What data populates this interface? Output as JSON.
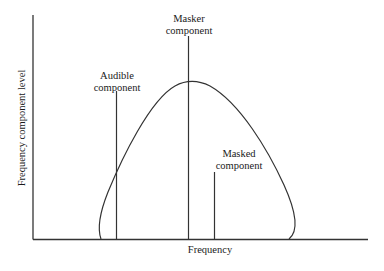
{
  "diagram": {
    "type": "frequency-masking-illustration",
    "x_axis_label": "Frequency",
    "y_axis_label": "Frequency component level",
    "components": [
      {
        "id": "audible",
        "label_line1": "Audible",
        "label_line2": "component"
      },
      {
        "id": "masker",
        "label_line1": "Masker",
        "label_line2": "component"
      },
      {
        "id": "masked",
        "label_line1": "Masked",
        "label_line2": "component"
      }
    ],
    "curve": "masking threshold curve",
    "colors": {
      "line": "#333333",
      "background": "#ffffff"
    }
  }
}
